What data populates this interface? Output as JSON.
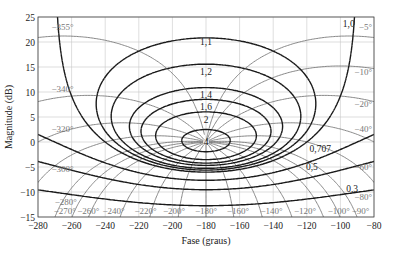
{
  "chart_data": {
    "type": "line",
    "title": "",
    "subtitle": "Nichols chart",
    "xlabel": "Fase (graus)",
    "ylabel": "Magnitude (dB)",
    "xlim": [
      -280,
      -80
    ],
    "ylim": [
      -15,
      25
    ],
    "xticks": [
      -280,
      -260,
      -240,
      -220,
      -200,
      -180,
      -160,
      -140,
      -120,
      -100,
      -80
    ],
    "yticks": [
      -15,
      -10,
      -5,
      0,
      5,
      10,
      15,
      20,
      25
    ],
    "grid": true,
    "legend": null,
    "m_contours": {
      "description": "Constant closed-loop magnitude M loci",
      "labels": [
        "1,0",
        "1,1",
        "1,2",
        "1,4",
        "1,6",
        "2",
        "4",
        "0,707",
        "0,5",
        "0,3"
      ],
      "values": [
        1.0,
        1.1,
        1.2,
        1.4,
        1.6,
        2,
        4,
        0.707,
        0.5,
        0.3
      ]
    },
    "n_contours": {
      "description": "Constant closed-loop phase loci (degrees)",
      "right_labels": [
        "-5°",
        "-10°",
        "-20°",
        "-40°",
        "-60°",
        "-80°",
        "-90°"
      ],
      "left_labels": [
        "-355°",
        "-340°",
        "-320°",
        "-300°",
        "-280°",
        "-270°"
      ],
      "bottom_labels": [
        "-270°",
        "-260°",
        "-240°",
        "-220°",
        "-200°",
        "-180°",
        "-160°",
        "-140°",
        "-120°",
        "-100°",
        "-90°"
      ],
      "values": [
        -5,
        -10,
        -20,
        -40,
        -60,
        -80,
        -90,
        -100,
        -120,
        -140,
        -160,
        -180,
        -200,
        -220,
        -240,
        -260,
        -270,
        -280,
        -300,
        -320,
        -340,
        -355
      ]
    },
    "annotations": [
      {
        "text": "1,0",
        "x": -95,
        "y": 23
      },
      {
        "text": "1,1",
        "x": -180,
        "y": 19.5
      },
      {
        "text": "1,2",
        "x": -180,
        "y": 13.5
      },
      {
        "text": "1,4",
        "x": -180,
        "y": 8.8
      },
      {
        "text": "1,6",
        "x": -180,
        "y": 6.5
      },
      {
        "text": "2",
        "x": -180,
        "y": 3.8
      },
      {
        "text": "4",
        "x": -180,
        "y": -0.5
      },
      {
        "text": "0,707",
        "x": -112,
        "y": -2
      },
      {
        "text": "0,5",
        "x": -117,
        "y": -5.5
      },
      {
        "text": "0,3",
        "x": -93,
        "y": -10
      }
    ]
  },
  "colors": {
    "m_line": "#1a1a1a",
    "n_line": "#7a7a7a",
    "grid": "#c8c8c8",
    "text": "#222222",
    "label_gray": "#777777"
  }
}
